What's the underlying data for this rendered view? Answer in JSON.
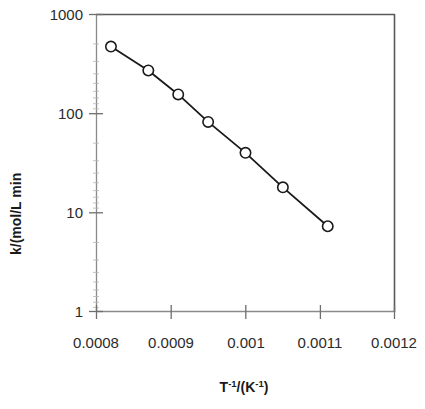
{
  "chart_data": {
    "type": "scatter",
    "title": "",
    "subtitle": "",
    "xlabel": "T-1/(K-1)",
    "xlabel_parts": {
      "base1": "T",
      "sup1": "-1",
      "mid": "/(K",
      "sup2": "-1",
      "end": ")"
    },
    "ylabel": "k/(mol/L min",
    "xscale": "linear",
    "yscale": "log",
    "xlim": [
      0.0008,
      0.0012
    ],
    "ylim": [
      1,
      1000
    ],
    "xticks": [
      0.0008,
      0.0009,
      0.001,
      0.0011,
      0.0012
    ],
    "xtick_labels": [
      "0.0008",
      "0.0009",
      "0.001",
      "0.0011",
      "0.0012"
    ],
    "yticks": [
      1,
      10,
      100,
      1000
    ],
    "ytick_labels": [
      "1",
      "10",
      "100",
      "1000"
    ],
    "grid": false,
    "legend": "none",
    "marker": "open-circle",
    "line_color": "#1a1a1a",
    "marker_edge_color": "#1a1a1a",
    "marker_face_color": "#ffffff",
    "axis_color": "#595959",
    "series": [
      {
        "name": "k vs 1/T",
        "x": [
          0.00082,
          0.00087,
          0.00091,
          0.00095,
          0.001,
          0.00105,
          0.00111
        ],
        "y": [
          470,
          270,
          155,
          82,
          40,
          18,
          7.3
        ]
      }
    ]
  }
}
